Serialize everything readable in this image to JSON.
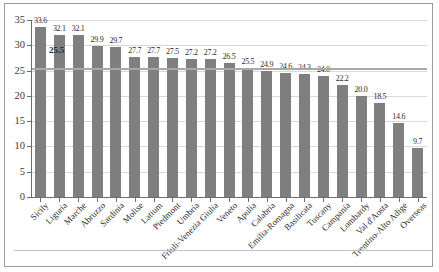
{
  "chart_data": {
    "type": "bar",
    "title": "",
    "xlabel": "",
    "ylabel": "",
    "ylim": [
      0,
      35
    ],
    "ytick_step": 5,
    "grid": true,
    "legend": false,
    "bar_color": "#7f7f7f",
    "reference_line": {
      "value": 25.5,
      "label": "25.5",
      "color": "#a8a8a8"
    },
    "yticks": [
      "0",
      "5",
      "10",
      "15",
      "20",
      "25",
      "30",
      "35"
    ],
    "categories": [
      "Sicily",
      "Liguria",
      "Marche",
      "Abruzzo",
      "Sardinia",
      "Molise",
      "Latium",
      "Piedmont",
      "Umbria",
      "Friuli-Venezia Giulia",
      "Veneto",
      "Apulia",
      "Calabria",
      "Emilia-Romagna",
      "Basilicata",
      "Tuscany",
      "Campania",
      "Lombardy",
      "Val d'Aosta",
      "Trentino-Alto Adige",
      "Overseas"
    ],
    "values": [
      33.6,
      32.1,
      32.1,
      29.9,
      29.7,
      27.7,
      27.7,
      27.5,
      27.2,
      27.2,
      26.5,
      25.5,
      24.9,
      24.6,
      24.3,
      24.0,
      22.2,
      20.0,
      18.5,
      14.6,
      9.7
    ],
    "value_labels": [
      "33.6",
      "32.1",
      "32.1",
      "29.9",
      "29.7",
      "27.7",
      "27.7",
      "27.5",
      "27.2",
      "27.2",
      "26.5",
      "25.5",
      "24.9",
      "24.6",
      "24.3",
      "24.0",
      "22.2",
      "20.0",
      "18.5",
      "14.6",
      "9.7"
    ]
  }
}
